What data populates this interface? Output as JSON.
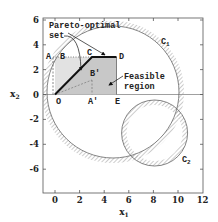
{
  "figure": {
    "x_axis": {
      "label": "x",
      "label_sub": "1",
      "ticks": [
        "0",
        "2",
        "4",
        "6",
        "8",
        "10",
        "12"
      ],
      "range": [
        -1,
        12
      ]
    },
    "y_axis": {
      "label": "x",
      "label_sub": "2",
      "ticks": [
        "6",
        "4",
        "2",
        "0",
        "-2",
        "-4",
        "-6"
      ],
      "range": [
        -7.8,
        6
      ]
    },
    "points": {
      "O": "O",
      "A": "A",
      "B": "B",
      "C": "C",
      "D": "D",
      "E": "E",
      "A_prime": "A′",
      "B_prime": "B′"
    },
    "curves": {
      "C1": {
        "label": "C",
        "sub": "1",
        "center": [
          4.7,
          0.2
        ],
        "radius": 5.3
      },
      "C2": {
        "label": "C",
        "sub": "2",
        "center": [
          8.1,
          -3.1
        ],
        "radius": 2.7
      }
    },
    "annotations": {
      "pareto_line1": "Pareto-optimal",
      "pareto_line2": "set",
      "feasible_line1": "Feasible",
      "feasible_line2": "region"
    },
    "colors": {
      "region_fill": "#c8c8c8",
      "region_fill_light": "#e2e2e2",
      "pareto_line": "#111111",
      "hatch": "#9a9a9a"
    }
  }
}
